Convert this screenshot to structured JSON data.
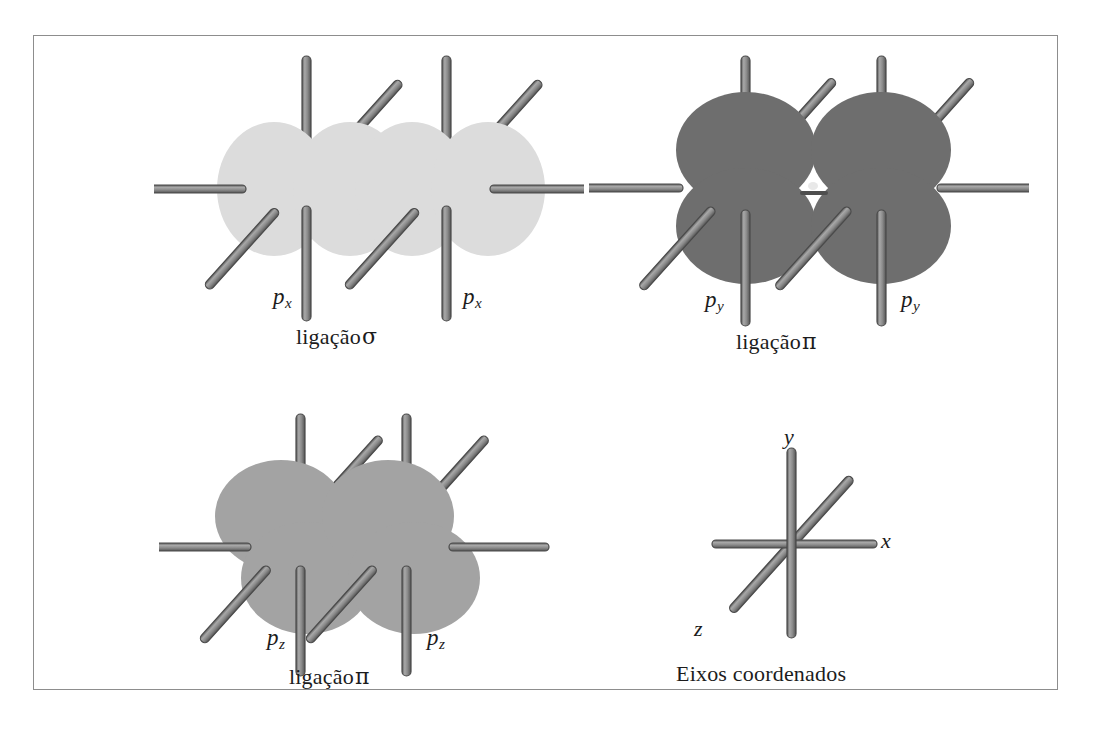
{
  "figure": {
    "panels": [
      {
        "id": "sigma-px",
        "caption_word": "ligação",
        "caption_symbol": "σ",
        "orbital_label_left": "p",
        "orbital_label_left_sub": "x",
        "orbital_label_right": "p",
        "orbital_label_right_sub": "x",
        "lobe_color": "#dcdcdc",
        "orientation": "horizontal",
        "bond_type": "sigma"
      },
      {
        "id": "pi-py",
        "caption_word": "ligação",
        "caption_symbol": "π",
        "orbital_label_left": "p",
        "orbital_label_left_sub": "y",
        "orbital_label_right": "p",
        "orbital_label_right_sub": "y",
        "lobe_color": "#6e6e6e",
        "orientation": "vertical",
        "bond_type": "pi"
      },
      {
        "id": "pi-pz",
        "caption_word": "ligação",
        "caption_symbol": "π",
        "orbital_label_left": "p",
        "orbital_label_left_sub": "z",
        "orbital_label_right": "p",
        "orbital_label_right_sub": "z",
        "lobe_color": "#a3a3a3",
        "orientation": "diagonal",
        "bond_type": "pi"
      },
      {
        "id": "axes",
        "caption_word": "Eixos coordenados",
        "caption_symbol": "",
        "axis_x": "x",
        "axis_y": "y",
        "axis_z": "z"
      }
    ],
    "colors": {
      "rod_fill": "#888888",
      "rod_stroke": "#4a4a4a",
      "frame_border": "#8d8d8d",
      "text": "#1c1c1c",
      "background": "#ffffff"
    }
  }
}
